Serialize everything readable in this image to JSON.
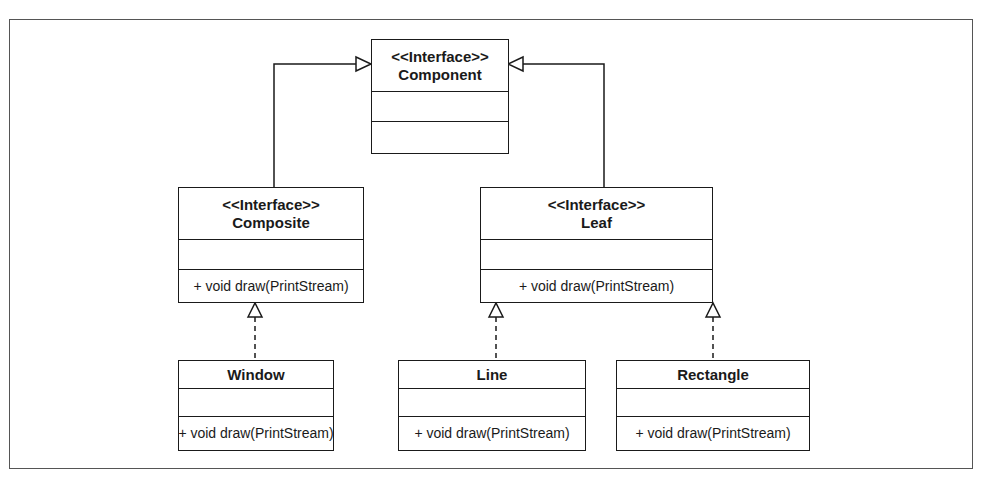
{
  "diagram": {
    "type": "UML class diagram",
    "pattern": "Composite",
    "classes": [
      {
        "id": "component",
        "stereotype": "<<Interface>>",
        "name": "Component",
        "attributes": [],
        "operations": []
      },
      {
        "id": "composite",
        "stereotype": "<<Interface>>",
        "name": "Composite",
        "attributes": [],
        "operations": [
          "+ void draw(PrintStream)"
        ]
      },
      {
        "id": "leaf",
        "stereotype": "<<Interface>>",
        "name": "Leaf",
        "attributes": [],
        "operations": [
          "+ void draw(PrintStream)"
        ]
      },
      {
        "id": "window",
        "stereotype": "",
        "name": "Window",
        "attributes": [],
        "operations": [
          "+ void draw(PrintStream)"
        ]
      },
      {
        "id": "line",
        "stereotype": "",
        "name": "Line",
        "attributes": [],
        "operations": [
          "+ void draw(PrintStream)"
        ]
      },
      {
        "id": "rectangle",
        "stereotype": "",
        "name": "Rectangle",
        "attributes": [],
        "operations": [
          "+ void draw(PrintStream)"
        ]
      }
    ],
    "relationships": [
      {
        "from": "composite",
        "to": "component",
        "kind": "generalization",
        "line": "solid"
      },
      {
        "from": "leaf",
        "to": "component",
        "kind": "generalization",
        "line": "solid"
      },
      {
        "from": "window",
        "to": "composite",
        "kind": "realization",
        "line": "dashed"
      },
      {
        "from": "line",
        "to": "leaf",
        "kind": "realization",
        "line": "dashed"
      },
      {
        "from": "rectangle",
        "to": "leaf",
        "kind": "realization",
        "line": "dashed"
      }
    ],
    "colors": {
      "stroke": "#1a1a1a",
      "frame": "#555555",
      "background": "#ffffff"
    }
  }
}
